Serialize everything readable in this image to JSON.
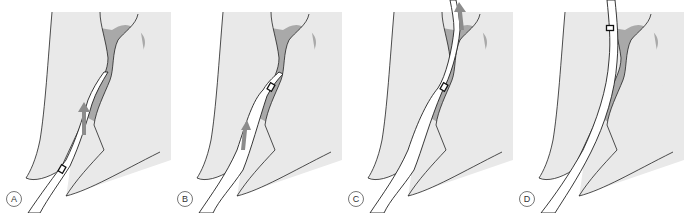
{
  "figure": {
    "panels": [
      {
        "id": "A",
        "label": "A",
        "stage": "instrument-entering",
        "arrow_direction": "up",
        "marker_position": "lower"
      },
      {
        "id": "B",
        "label": "B",
        "stage": "instrument-advancing",
        "arrow_direction": "up",
        "marker_position": "middle"
      },
      {
        "id": "C",
        "label": "C",
        "stage": "instrument-at-apex",
        "arrow_direction": "up",
        "marker_position": "middle"
      },
      {
        "id": "D",
        "label": "D",
        "stage": "instrument-fully-inserted",
        "arrow_direction": "none",
        "marker_position": "upper"
      }
    ],
    "colors": {
      "bone": "#e9e9e9",
      "lesion": "#a9a9a9",
      "canal": "#ffffff",
      "outline": "#222222",
      "arrow": "#8c8c8c"
    }
  }
}
